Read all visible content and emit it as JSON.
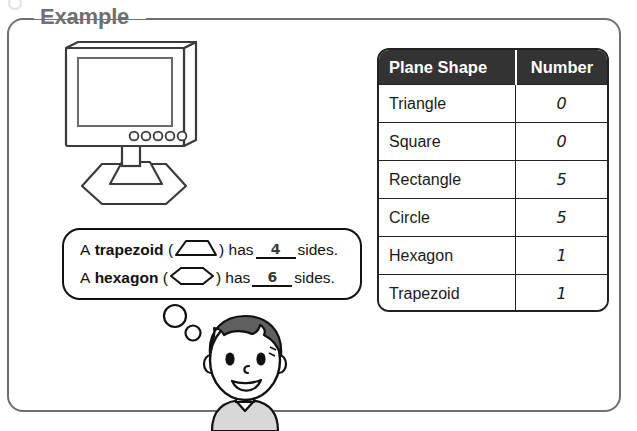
{
  "worksheet": {
    "section_label": "Example"
  },
  "illustration": {
    "monitor_icon": "computer-monitor-icon",
    "monitor_buttons": 5,
    "boy_icon": "thinking-boy-icon",
    "thought_bubbles": 2
  },
  "sentences": [
    {
      "lead": "A",
      "shape_name": "trapezoid",
      "open_paren": "(",
      "shape_glyph": "trapezoid-glyph",
      "close_paren": ")",
      "verb": "has",
      "answer": "4",
      "tail": "sides."
    },
    {
      "lead": "A",
      "shape_name": "hexagon",
      "open_paren": "(",
      "shape_glyph": "hexagon-glyph",
      "close_paren": ")",
      "verb": "has",
      "answer": "6",
      "tail": "sides."
    }
  ],
  "table": {
    "headers": [
      "Plane Shape",
      "Number"
    ],
    "rows": [
      {
        "shape": "Triangle",
        "number": "0"
      },
      {
        "shape": "Square",
        "number": "0"
      },
      {
        "shape": "Rectangle",
        "number": "5"
      },
      {
        "shape": "Circle",
        "number": "5"
      },
      {
        "shape": "Hexagon",
        "number": "1"
      },
      {
        "shape": "Trapezoid",
        "number": "1"
      }
    ]
  },
  "colors": {
    "frame_border": "#6f6f6f",
    "label_text": "#6f6f6f",
    "table_header_bg": "#333333",
    "table_header_text": "#ffffff",
    "table_border": "#222222",
    "handwritten_answer": "#707070",
    "hair": "#5f5f5f",
    "shirt": "#d8d8d8",
    "outline": "#111111"
  }
}
